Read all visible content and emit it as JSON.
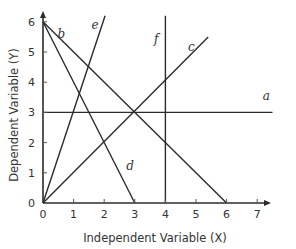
{
  "chart_data": {
    "type": "line",
    "title": "",
    "xlabel": "Independent Variable (X)",
    "ylabel": "Dependent Variable (Y)",
    "xlim": [
      0,
      7.6
    ],
    "ylim": [
      0,
      6.3
    ],
    "grid": false,
    "legend": "none (lines labeled directly)",
    "x_ticks": [
      "0",
      "1",
      "2",
      "3",
      "4",
      "5",
      "6",
      "7"
    ],
    "y_ticks": [
      "0",
      "1",
      "2",
      "3",
      "4",
      "5",
      "6"
    ],
    "series": [
      {
        "name": "a",
        "description": "horizontal line Y = 3",
        "points": [
          [
            0,
            3
          ],
          [
            7.5,
            3
          ]
        ],
        "label_at": [
          7.3,
          3.4
        ]
      },
      {
        "name": "b",
        "description": "Y = 6 - X",
        "points": [
          [
            0,
            6
          ],
          [
            6,
            0
          ]
        ],
        "label_at": [
          0.6,
          5.45
        ]
      },
      {
        "name": "c",
        "description": "Y = X",
        "points": [
          [
            0,
            0
          ],
          [
            5.4,
            5.5
          ]
        ],
        "label_at": [
          4.85,
          5.05
        ]
      },
      {
        "name": "d",
        "description": "Y = 6 - 2X",
        "points": [
          [
            0,
            6
          ],
          [
            3,
            0
          ]
        ],
        "label_at": [
          2.85,
          1.1
        ]
      },
      {
        "name": "e",
        "description": "Y = 3X",
        "points": [
          [
            0,
            0
          ],
          [
            2.03,
            6.2
          ]
        ],
        "label_at": [
          1.7,
          5.75
        ]
      },
      {
        "name": "f",
        "description": "vertical line X = 4",
        "points": [
          [
            4,
            0
          ],
          [
            4,
            6.2
          ]
        ],
        "label_at": [
          3.7,
          5.3
        ]
      }
    ]
  }
}
